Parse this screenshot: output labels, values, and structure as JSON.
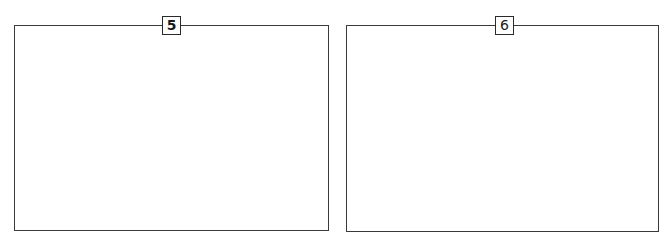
{
  "panels": [
    {
      "id": "5",
      "label": "5",
      "content": ""
    },
    {
      "id": "6",
      "label": "6",
      "content": ""
    }
  ],
  "colors": {
    "border": "#3a3a3a",
    "label_border": "#2a2a2a",
    "label_text": "#1a1a1a",
    "background": "#ffffff"
  }
}
